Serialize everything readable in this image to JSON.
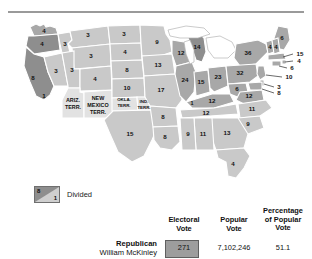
{
  "top_rule": true,
  "legend": {
    "divided_label": "Divided",
    "divided_upper_value": "8",
    "divided_lower_value": "1"
  },
  "results_table": {
    "columns": [
      {
        "id": "electoral",
        "label_line1": "Electoral",
        "label_line2": "Vote"
      },
      {
        "id": "popular",
        "label_line1": "Popular",
        "label_line2": "Vote"
      },
      {
        "id": "percentage",
        "label_line1": "Percentage",
        "label_line2": "of Popular",
        "label_line3": "Vote"
      }
    ],
    "rows": [
      {
        "party": "Republican",
        "candidate": "William McKinley",
        "swatch_color": "#9d9d9d",
        "electoral_vote": "271",
        "popular_vote": "7,102,246",
        "percentage_of_popular_vote": "51.1"
      }
    ]
  },
  "colors": {
    "state_dark": "#8e8e8e",
    "state_mid": "#a8a8a8",
    "state_light": "#c9c9c9",
    "territory": "#e2e2e2",
    "border": "#ffffff",
    "rule": "#9a9a9a"
  },
  "map": {
    "territories": [
      {
        "id": "arizona-territory",
        "label_lines": [
          "ARIZ.",
          "TERR."
        ]
      },
      {
        "id": "new-mexico-territory",
        "label_lines": [
          "NEW",
          "MEXICO",
          "TERR."
        ]
      },
      {
        "id": "oklahoma-territory",
        "label_lines": [
          "OKLA.",
          "TERR."
        ]
      },
      {
        "id": "indian-territory",
        "label_lines": [
          "IND.",
          "TERR."
        ]
      }
    ],
    "states": [
      {
        "id": "washington",
        "value": "4"
      },
      {
        "id": "oregon",
        "value": "4"
      },
      {
        "id": "california",
        "value": "8",
        "divided_value": "1",
        "divided": true
      },
      {
        "id": "nevada",
        "value": "3"
      },
      {
        "id": "idaho",
        "value": "3"
      },
      {
        "id": "montana",
        "value": "3"
      },
      {
        "id": "wyoming",
        "value": "3"
      },
      {
        "id": "utah",
        "value": "3"
      },
      {
        "id": "colorado",
        "value": "4"
      },
      {
        "id": "north-dakota",
        "value": "3"
      },
      {
        "id": "south-dakota",
        "value": "4"
      },
      {
        "id": "nebraska",
        "value": "8"
      },
      {
        "id": "kansas",
        "value": "10"
      },
      {
        "id": "texas",
        "value": "15"
      },
      {
        "id": "minnesota",
        "value": "9"
      },
      {
        "id": "iowa",
        "value": "13"
      },
      {
        "id": "missouri",
        "value": "17"
      },
      {
        "id": "arkansas",
        "value": "8"
      },
      {
        "id": "louisiana",
        "value": "8"
      },
      {
        "id": "wisconsin",
        "value": "12"
      },
      {
        "id": "illinois",
        "value": "24"
      },
      {
        "id": "michigan",
        "value": "14"
      },
      {
        "id": "indiana",
        "value": "15"
      },
      {
        "id": "ohio",
        "value": "23"
      },
      {
        "id": "kentucky",
        "value": "12",
        "divided_value": "1",
        "divided": true
      },
      {
        "id": "tennessee",
        "value": "12"
      },
      {
        "id": "mississippi",
        "value": "9"
      },
      {
        "id": "alabama",
        "value": "11"
      },
      {
        "id": "georgia",
        "value": "13"
      },
      {
        "id": "florida",
        "value": "4"
      },
      {
        "id": "south-carolina",
        "value": "9"
      },
      {
        "id": "north-carolina",
        "value": "11"
      },
      {
        "id": "virginia",
        "value": "12"
      },
      {
        "id": "west-virginia",
        "value": "6"
      },
      {
        "id": "pennsylvania",
        "value": "32"
      },
      {
        "id": "new-york",
        "value": "36"
      },
      {
        "id": "maine",
        "value": "6"
      },
      {
        "id": "vermont",
        "value": "4"
      },
      {
        "id": "new-hampshire",
        "value": "4"
      },
      {
        "id": "massachusetts",
        "value": "15"
      },
      {
        "id": "rhode-island",
        "value": "4"
      },
      {
        "id": "connecticut",
        "value": "6"
      },
      {
        "id": "new-jersey",
        "value": "10"
      },
      {
        "id": "delaware",
        "value": "3"
      },
      {
        "id": "maryland",
        "value": "8"
      }
    ]
  }
}
